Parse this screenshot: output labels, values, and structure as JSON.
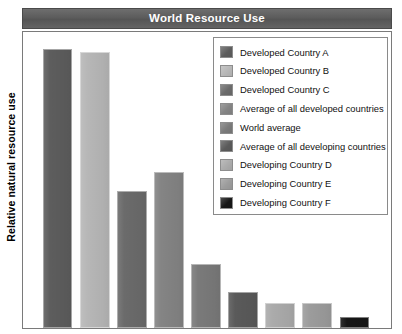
{
  "chart_data": {
    "type": "bar",
    "title": "World Resource Use",
    "xlabel": "",
    "ylabel": "Relative natural resource use",
    "ylim": [
      0,
      106
    ],
    "grid": false,
    "legend_position": "top-right",
    "categories": [
      "Developed Country A",
      "Developed Country B",
      "Developed Country C",
      "Average of all developed countries",
      "World average",
      "Average of all developing countries",
      "Developing Country D",
      "Developing Country E",
      "Developing Country F"
    ],
    "values": [
      100,
      99,
      49,
      56,
      23,
      13,
      9,
      9,
      4
    ],
    "colors": [
      "#5d5d5d",
      "#b7b7b7",
      "#6b6b6b",
      "#848484",
      "#7a7a7a",
      "#5a5a5a",
      "#ababab",
      "#9c9c9c",
      "#161616"
    ],
    "tick_labels": [],
    "axis_ticks_visible": false
  },
  "title": {
    "text": "World Resource Use"
  },
  "axes": {
    "y_label": "Relative natural resource use"
  },
  "legend": {
    "items": [
      {
        "label": "Developed Country A",
        "color": "#5d5d5d"
      },
      {
        "label": "Developed Country B",
        "color": "#b7b7b7"
      },
      {
        "label": "Developed Country C",
        "color": "#6b6b6b"
      },
      {
        "label": "Average of all developed countries",
        "color": "#848484"
      },
      {
        "label": "World average",
        "color": "#7a7a7a"
      },
      {
        "label": "Average of all developing countries",
        "color": "#5a5a5a"
      },
      {
        "label": "Developing Country D",
        "color": "#ababab"
      },
      {
        "label": "Developing Country E",
        "color": "#9c9c9c"
      },
      {
        "label": "Developing Country F",
        "color": "#161616"
      }
    ]
  },
  "colors": {
    "title_bar_background": "#5c5c5c",
    "title_text": "#ffffff",
    "plot_border": "#7a7a7a",
    "legend_border": "#8a8a8a",
    "page_background": "#ffffff"
  }
}
